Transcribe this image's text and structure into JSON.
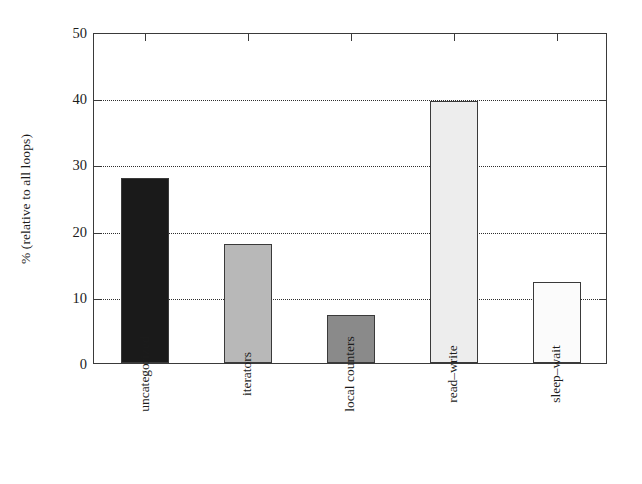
{
  "chart_data": {
    "type": "bar",
    "title": "",
    "xlabel": "",
    "ylabel": "% (relative to all loops)",
    "categories": [
      "uncategorized",
      "iterators",
      "local counters",
      "read–write",
      "sleep–wait"
    ],
    "values": [
      27.9,
      18.0,
      7.2,
      39.6,
      12.3
    ],
    "bar_colors": [
      "#1a1a1a",
      "#b8b8b8",
      "#8a8a8a",
      "#ededed",
      "#fbfbfb"
    ],
    "bar_edge_color": "#3a3a3a",
    "ylim": [
      0,
      50
    ],
    "ytick_labels": [
      "0",
      "10",
      "20",
      "30",
      "40",
      "50"
    ],
    "ytick_values": [
      0,
      10,
      20,
      30,
      40,
      50
    ],
    "grid": "horizontal-dotted",
    "gridline_values": [
      10,
      20,
      30,
      40
    ],
    "legend": "none",
    "xtick_label_rotation": 90
  }
}
